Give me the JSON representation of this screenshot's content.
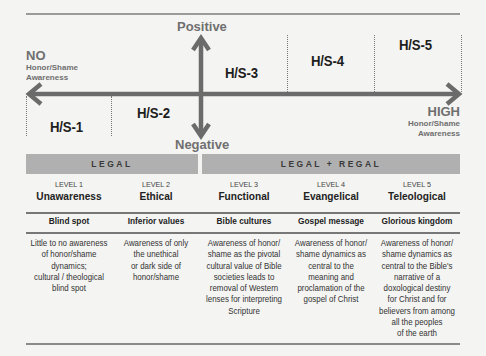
{
  "axis": {
    "top": "Positive",
    "bottom": "Negative",
    "left": {
      "title": "NO",
      "line1": "Honor/Shame",
      "line2": "Awareness"
    },
    "right": {
      "title": "HIGH",
      "line1": "Honor/Shame",
      "line2": "Awareness"
    },
    "arrow_color": "#6b6b6b"
  },
  "zones": [
    {
      "label": "H/S-1"
    },
    {
      "label": "H/S-2"
    },
    {
      "label": "H/S-3"
    },
    {
      "label": "H/S-4"
    },
    {
      "label": "H/S-5"
    }
  ],
  "bands": [
    {
      "label": "LEGAL"
    },
    {
      "label": "LEGAL + REGAL"
    }
  ],
  "levels": [
    {
      "level": "LEVEL 1",
      "name": "Unawareness",
      "subtitle": "Blind spot",
      "description": [
        "Little to no awareness",
        "of honor/shame",
        "dynamics;",
        "cultural / theological",
        "blind spot"
      ]
    },
    {
      "level": "LEVEL 2",
      "name": "Ethical",
      "subtitle": "Inferior values",
      "description": [
        "Awareness of only",
        "the unethical",
        "or dark side of",
        "honor/shame"
      ]
    },
    {
      "level": "LEVEL 3",
      "name": "Functional",
      "subtitle": "Bible cultures",
      "description": [
        "Awareness of honor/",
        "shame as the pivotal",
        "cultural value of Bible",
        "societies leads to",
        "removal of Western",
        "lenses for interpreting",
        "Scripture"
      ]
    },
    {
      "level": "LEVEL 4",
      "name": "Evangelical",
      "subtitle": "Gospel message",
      "description": [
        "Awareness of honor/",
        "shame dynamics as",
        "central to the",
        "meaning and",
        "proclamation of the",
        "gospel of Christ"
      ]
    },
    {
      "level": "LEVEL 5",
      "name": "Teleological",
      "subtitle": "Glorious kingdom",
      "description": [
        "Awareness of honor/",
        "shame dynamics as",
        "central to the Bible's",
        "narrative of a",
        "doxological destiny",
        "for Christ and for",
        "believers from among",
        "all the peoples",
        "of the earth"
      ]
    }
  ]
}
